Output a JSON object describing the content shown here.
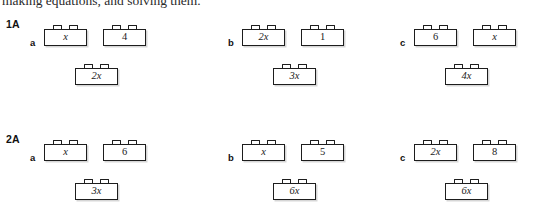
{
  "intro": {
    "text": "making equations, and solving them."
  },
  "sections": [
    {
      "label": "1A",
      "items": [
        {
          "letter": "a",
          "top": [
            {
              "text": "x",
              "italic": true
            },
            {
              "text": "4",
              "italic": false
            }
          ],
          "bottom": [
            {
              "text": "2x",
              "italic": true
            }
          ]
        },
        {
          "letter": "b",
          "top": [
            {
              "text": "2x",
              "italic": true
            },
            {
              "text": "1",
              "italic": false
            }
          ],
          "bottom": [
            {
              "text": "3x",
              "italic": true
            }
          ]
        },
        {
          "letter": "c",
          "top": [
            {
              "text": "6",
              "italic": false
            },
            {
              "text": "x",
              "italic": true
            }
          ],
          "bottom": [
            {
              "text": "4x",
              "italic": true
            }
          ]
        }
      ]
    },
    {
      "label": "2A",
      "items": [
        {
          "letter": "a",
          "top": [
            {
              "text": "x",
              "italic": true
            },
            {
              "text": "6",
              "italic": false
            }
          ],
          "bottom": [
            {
              "text": "3x",
              "italic": true
            }
          ]
        },
        {
          "letter": "b",
          "top": [
            {
              "text": "x",
              "italic": true
            },
            {
              "text": "5",
              "italic": false
            }
          ],
          "bottom": [
            {
              "text": "6x",
              "italic": true
            }
          ]
        },
        {
          "letter": "c",
          "top": [
            {
              "text": "2x",
              "italic": true
            },
            {
              "text": "8",
              "italic": false
            }
          ],
          "bottom": [
            {
              "text": "6x",
              "italic": true
            }
          ]
        }
      ]
    }
  ],
  "layout": {
    "section_tops": [
      18,
      133
    ],
    "item_lefts": [
      30,
      228,
      400
    ]
  },
  "colors": {
    "ink": "#1d1d1d",
    "paper": "#ffffff"
  }
}
